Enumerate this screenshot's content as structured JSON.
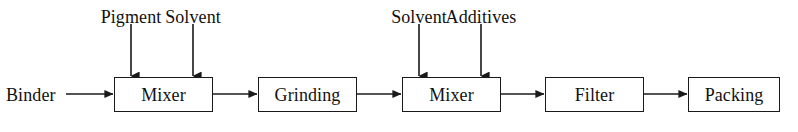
{
  "diagram": {
    "type": "process-flow",
    "background_color": "#ffffff",
    "line_color": "#1a1a1a",
    "text_color": "#111111",
    "width": 798,
    "height": 132,
    "process_boxes": [
      {
        "id": "mixer-1",
        "label": "Mixer",
        "x": 114,
        "y": 77,
        "w": 99,
        "h": 35
      },
      {
        "id": "grinding",
        "label": "Grinding",
        "x": 258,
        "y": 77,
        "w": 99,
        "h": 35
      },
      {
        "id": "mixer-2",
        "label": "Mixer",
        "x": 402,
        "y": 77,
        "w": 99,
        "h": 35
      },
      {
        "id": "filter",
        "label": "Filter",
        "x": 545,
        "y": 77,
        "w": 99,
        "h": 35
      },
      {
        "id": "packing",
        "label": "Packing",
        "x": 688,
        "y": 77,
        "w": 92,
        "h": 35
      }
    ],
    "input_streams": [
      {
        "id": "binder",
        "label": "Binder",
        "direction": "horizontal",
        "target": "mixer-1",
        "label_x": 6,
        "label_y": 86,
        "arrow_from_x": 66,
        "arrow_to_x": 114,
        "arrow_y": 94
      },
      {
        "id": "pigment",
        "label": "Pigment",
        "direction": "vertical",
        "target": "mixer-1",
        "label_x": 131,
        "label_y": 8,
        "arrow_x": 131,
        "arrow_from_y": 24,
        "arrow_to_y": 77
      },
      {
        "id": "solvent-1",
        "label": "Solvent",
        "direction": "vertical",
        "target": "mixer-1",
        "label_x": 193,
        "label_y": 8,
        "arrow_x": 193,
        "arrow_from_y": 24,
        "arrow_to_y": 77
      },
      {
        "id": "solvent-2",
        "label": "Solvent",
        "direction": "vertical",
        "target": "mixer-2",
        "label_x": 419,
        "label_y": 8,
        "arrow_x": 419,
        "arrow_from_y": 24,
        "arrow_to_y": 77
      },
      {
        "id": "additives",
        "label": "Additives",
        "direction": "vertical",
        "target": "mixer-2",
        "label_x": 481,
        "label_y": 8,
        "arrow_x": 481,
        "arrow_from_y": 24,
        "arrow_to_y": 77
      }
    ],
    "connectors": [
      {
        "id": "mixer1-to-grinding",
        "from": "mixer-1",
        "to": "grinding",
        "from_x": 213,
        "to_x": 258,
        "y": 94
      },
      {
        "id": "grinding-to-mixer2",
        "from": "grinding",
        "to": "mixer-2",
        "from_x": 357,
        "to_x": 402,
        "y": 94
      },
      {
        "id": "mixer2-to-filter",
        "from": "mixer-2",
        "to": "filter",
        "from_x": 501,
        "to_x": 545,
        "y": 94
      },
      {
        "id": "filter-to-packing",
        "from": "filter",
        "to": "packing",
        "from_x": 644,
        "to_x": 688,
        "y": 94
      }
    ]
  }
}
